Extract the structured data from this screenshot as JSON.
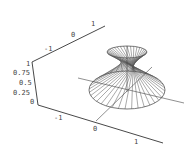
{
  "chart_data": {
    "type": "surface3d",
    "title": "",
    "xlabel": "",
    "ylabel": "",
    "zlabel": "",
    "axes": {
      "back_axis": {
        "ticks": [
          "-1",
          "0",
          "1"
        ],
        "range": [
          -1.3,
          1.3
        ]
      },
      "front_axis": {
        "ticks": [
          "-1",
          "0",
          "1"
        ],
        "range": [
          -1.3,
          1.3
        ]
      },
      "z_axis": {
        "ticks": [
          "0",
          "0.25",
          "0.5",
          "0.75",
          "1"
        ],
        "range": [
          0,
          1
        ]
      }
    },
    "surface": {
      "top_radius": 0.5,
      "waist_radius": 0.15,
      "bottom_radius": 1.0,
      "generators": 36,
      "line_color": "#555555"
    },
    "grid": false,
    "legend": null
  },
  "labels": {
    "back": [
      "-1",
      "0",
      "1"
    ],
    "front": [
      "-1",
      "0",
      "1"
    ],
    "z": [
      "1",
      "0.75",
      "0.5",
      "0.25",
      "0"
    ]
  },
  "colors": {
    "axis": "#333333",
    "surface": "#555555",
    "background": "#ffffff"
  }
}
